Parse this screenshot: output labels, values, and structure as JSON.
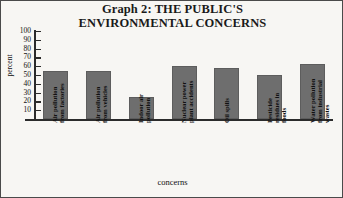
{
  "figure": {
    "title_line1": "Graph 2: THE PUBLIC'S",
    "title_line2": "ENVIRONMENTAL CONCERNS",
    "bar_color": "#6e6e6e",
    "axis_color": "#2b2b2b",
    "background": "#f7f6f3"
  },
  "chart_data": {
    "type": "bar",
    "title": "Graph 2: THE PUBLIC'S ENVIRONMENTAL CONCERNS",
    "xlabel": "concerns",
    "ylabel": "percent",
    "ylim": [
      0,
      100
    ],
    "yticks": [
      10,
      20,
      30,
      40,
      50,
      60,
      70,
      80,
      90,
      100
    ],
    "grid": false,
    "legend": null,
    "categories": [
      "Air pollution from factories",
      "Air pollution from vehicles",
      "Indoor air pollution",
      "Nuclear power plant accidents",
      "Oil spills",
      "Pesticide residues in foods",
      "Water pollution from industrial wastes"
    ],
    "values": [
      55,
      55,
      25,
      60,
      58,
      50,
      62
    ]
  },
  "ytick_labels": [
    "100",
    "90",
    "80",
    "70",
    "60",
    "50",
    "40",
    "30",
    "20",
    "10"
  ]
}
